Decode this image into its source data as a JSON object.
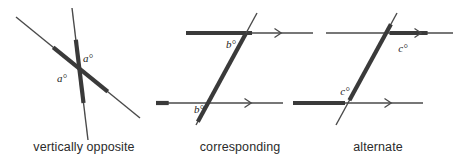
{
  "figure": {
    "title_visible": false,
    "background_color": "#ffffff",
    "line_color_thin": "#4a4a4a",
    "line_color_thick": "#3a3a3a",
    "text_color": "#2b2b2b",
    "panel_count": 3
  },
  "panels": [
    {
      "id": "vertically-opposite",
      "caption": "vertically opposite",
      "caption_x": 84,
      "caption_y": 140,
      "angle_labels": [
        {
          "text": "a°",
          "x": 88,
          "y": 62
        },
        {
          "text": "a°",
          "x": 62,
          "y": 82
        }
      ],
      "lines": [
        {
          "name": "line-descending",
          "x1": 16,
          "y1": 17,
          "x2": 140,
          "y2": 118,
          "thick_from": 0.3,
          "thick_to": 0.74
        },
        {
          "name": "line-steep",
          "x1": 72,
          "y1": 8,
          "x2": 88,
          "y2": 140,
          "thick_from": 0.24,
          "thick_to": 0.72
        }
      ],
      "arrows": []
    },
    {
      "id": "corresponding",
      "caption": "corresponding",
      "caption_x": 240,
      "caption_y": 140,
      "angle_labels": [
        {
          "text": "b°",
          "x": 231,
          "y": 48
        },
        {
          "text": "b°",
          "x": 199,
          "y": 113
        }
      ],
      "lines": [
        {
          "name": "parallel-line-top",
          "x1": 186,
          "y1": 33,
          "x2": 313,
          "y2": 33,
          "thick_from": 0.0,
          "thick_to": 0.52
        },
        {
          "name": "parallel-line-bottom",
          "x1": 156,
          "y1": 103,
          "x2": 283,
          "y2": 103,
          "thick_from": 0.0,
          "thick_to": 0.1
        },
        {
          "name": "transversal",
          "x1": 257,
          "y1": 13,
          "x2": 196,
          "y2": 125,
          "thick_from": 0.18,
          "thick_to": 0.97
        }
      ],
      "arrows": [
        {
          "name": "arrow-marker-top",
          "x": 278,
          "y": 33
        },
        {
          "name": "arrow-marker-bottom",
          "x": 248,
          "y": 103
        }
      ]
    },
    {
      "id": "alternate",
      "caption": "alternate",
      "caption_x": 378,
      "caption_y": 140,
      "angle_labels": [
        {
          "text": "c°",
          "x": 403,
          "y": 52
        },
        {
          "text": "c°",
          "x": 345,
          "y": 95
        }
      ],
      "lines": [
        {
          "name": "parallel-line-top",
          "x1": 326,
          "y1": 33,
          "x2": 453,
          "y2": 33,
          "thick_from": 0.5,
          "thick_to": 0.8
        },
        {
          "name": "parallel-line-bottom",
          "x1": 293,
          "y1": 103,
          "x2": 423,
          "y2": 103,
          "thick_from": 0.0,
          "thick_to": 0.4
        },
        {
          "name": "transversal",
          "x1": 397,
          "y1": 13,
          "x2": 336,
          "y2": 125,
          "thick_from": 0.1,
          "thick_to": 0.78
        }
      ],
      "arrows": [
        {
          "name": "arrow-marker-top",
          "x": 418,
          "y": 33
        },
        {
          "name": "arrow-marker-bottom",
          "x": 388,
          "y": 103
        }
      ]
    }
  ]
}
